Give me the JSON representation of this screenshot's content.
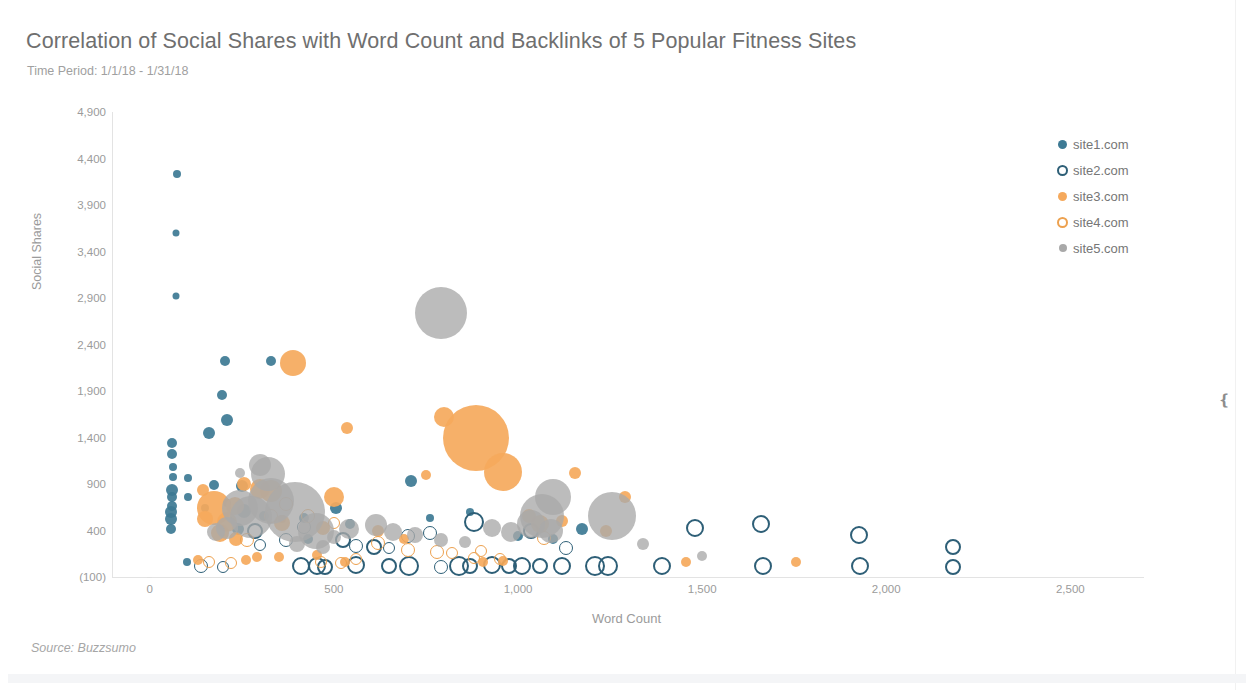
{
  "header": {
    "title": "Correlation of Social Shares with Word Count and Backlinks of 5 Popular Fitness Sites",
    "subtitle": "Time Period: 1/1/18 - 1/31/18"
  },
  "footer": {
    "source": "Source: Buzzsumo"
  },
  "right_widget": {
    "collapse_glyph": "❴"
  },
  "colors": {
    "site1": "#3d7a94",
    "site2": "#2e5f77",
    "site3": "#f5a95c",
    "site4": "#eda14f",
    "site5": "#a9a9a9",
    "axis_text": "#9b9b9b",
    "title_text": "#6f6f6f"
  },
  "chart_data": {
    "type": "scatter",
    "title": "Correlation of Social Shares with Word Count and Backlinks of 5 Popular Fitness Sites",
    "subtitle": "Time Period: 1/1/18 - 1/31/18",
    "xlabel": "Word Count",
    "ylabel": "Social Shares",
    "xlim": [
      -100,
      2700
    ],
    "ylim": [
      -100,
      4900
    ],
    "grid": false,
    "legend_position": "right",
    "size_encodes": "Backlinks",
    "xticks": [
      {
        "value": 0,
        "label": "0"
      },
      {
        "value": 500,
        "label": "500"
      },
      {
        "value": 1000,
        "label": "1,000"
      },
      {
        "value": 1500,
        "label": "1,500"
      },
      {
        "value": 2000,
        "label": "2,000"
      },
      {
        "value": 2500,
        "label": "2,500"
      }
    ],
    "yticks": [
      {
        "value": 4900,
        "label": "4,900"
      },
      {
        "value": 4400,
        "label": "4,400"
      },
      {
        "value": 3900,
        "label": "3,900"
      },
      {
        "value": 3400,
        "label": "3,400"
      },
      {
        "value": 2900,
        "label": "2,900"
      },
      {
        "value": 2400,
        "label": "2,400"
      },
      {
        "value": 1900,
        "label": "1,900"
      },
      {
        "value": 1400,
        "label": "1,400"
      },
      {
        "value": 900,
        "label": "900"
      },
      {
        "value": 400,
        "label": "400"
      },
      {
        "value": -100,
        "label": "(100)"
      }
    ],
    "series": [
      {
        "name": "site1.com",
        "marker": "filled-circle",
        "color": "#3d7a94",
        "points": [
          {
            "x": 75,
            "y": 4230,
            "r": 4
          },
          {
            "x": 70,
            "y": 3600,
            "r": 3.5
          },
          {
            "x": 70,
            "y": 2920,
            "r": 3.5
          },
          {
            "x": 205,
            "y": 2220,
            "r": 5
          },
          {
            "x": 330,
            "y": 2225,
            "r": 5
          },
          {
            "x": 195,
            "y": 1860,
            "r": 5
          },
          {
            "x": 160,
            "y": 1450,
            "r": 6
          },
          {
            "x": 210,
            "y": 1590,
            "r": 6
          },
          {
            "x": 60,
            "y": 1340,
            "r": 5
          },
          {
            "x": 60,
            "y": 1220,
            "r": 5
          },
          {
            "x": 62,
            "y": 1080,
            "r": 4
          },
          {
            "x": 62,
            "y": 980,
            "r": 4
          },
          {
            "x": 105,
            "y": 960,
            "r": 4
          },
          {
            "x": 60,
            "y": 840,
            "r": 6
          },
          {
            "x": 60,
            "y": 760,
            "r": 5
          },
          {
            "x": 60,
            "y": 660,
            "r": 5
          },
          {
            "x": 58,
            "y": 600,
            "r": 6
          },
          {
            "x": 58,
            "y": 520,
            "r": 6
          },
          {
            "x": 58,
            "y": 420,
            "r": 5
          },
          {
            "x": 105,
            "y": 760,
            "r": 4
          },
          {
            "x": 175,
            "y": 890,
            "r": 5
          },
          {
            "x": 150,
            "y": 640,
            "r": 4
          },
          {
            "x": 210,
            "y": 700,
            "r": 4
          },
          {
            "x": 250,
            "y": 880,
            "r": 6
          },
          {
            "x": 255,
            "y": 610,
            "r": 7
          },
          {
            "x": 240,
            "y": 420,
            "r": 6
          },
          {
            "x": 310,
            "y": 560,
            "r": 5
          },
          {
            "x": 360,
            "y": 520,
            "r": 4
          },
          {
            "x": 420,
            "y": 530,
            "r": 5
          },
          {
            "x": 505,
            "y": 640,
            "r": 6
          },
          {
            "x": 545,
            "y": 475,
            "r": 5
          },
          {
            "x": 710,
            "y": 930,
            "r": 6
          },
          {
            "x": 760,
            "y": 530,
            "r": 4
          },
          {
            "x": 870,
            "y": 600,
            "r": 4
          },
          {
            "x": 1000,
            "y": 340,
            "r": 5
          },
          {
            "x": 1095,
            "y": 310,
            "r": 5
          },
          {
            "x": 1175,
            "y": 420,
            "r": 6
          },
          {
            "x": 100,
            "y": 60,
            "r": 4
          },
          {
            "x": 430,
            "y": 310,
            "r": 5
          }
        ]
      },
      {
        "name": "site2.com",
        "marker": "hollow-circle",
        "color": "#2e5f77",
        "points": [
          {
            "x": 140,
            "y": 20,
            "r": 7
          },
          {
            "x": 200,
            "y": 10,
            "r": 6
          },
          {
            "x": 410,
            "y": 15,
            "r": 9
          },
          {
            "x": 455,
            "y": 20,
            "r": 9
          },
          {
            "x": 475,
            "y": 10,
            "r": 8
          },
          {
            "x": 560,
            "y": 25,
            "r": 9
          },
          {
            "x": 650,
            "y": 20,
            "r": 8
          },
          {
            "x": 705,
            "y": 15,
            "r": 10
          },
          {
            "x": 790,
            "y": 10,
            "r": 7
          },
          {
            "x": 840,
            "y": 20,
            "r": 10
          },
          {
            "x": 870,
            "y": 15,
            "r": 8
          },
          {
            "x": 930,
            "y": 25,
            "r": 9
          },
          {
            "x": 975,
            "y": 20,
            "r": 8
          },
          {
            "x": 1010,
            "y": 15,
            "r": 9
          },
          {
            "x": 1060,
            "y": 15,
            "r": 8
          },
          {
            "x": 1120,
            "y": 20,
            "r": 9
          },
          {
            "x": 1210,
            "y": 20,
            "r": 10
          },
          {
            "x": 1245,
            "y": 15,
            "r": 10
          },
          {
            "x": 1390,
            "y": 15,
            "r": 9
          },
          {
            "x": 1665,
            "y": 20,
            "r": 9
          },
          {
            "x": 1930,
            "y": 15,
            "r": 9
          },
          {
            "x": 2180,
            "y": 10,
            "r": 8
          },
          {
            "x": 525,
            "y": 300,
            "r": 8
          },
          {
            "x": 610,
            "y": 225,
            "r": 8
          },
          {
            "x": 700,
            "y": 340,
            "r": 7
          },
          {
            "x": 880,
            "y": 490,
            "r": 10
          },
          {
            "x": 760,
            "y": 370,
            "r": 7
          },
          {
            "x": 1035,
            "y": 400,
            "r": 8
          },
          {
            "x": 1480,
            "y": 430,
            "r": 9
          },
          {
            "x": 1660,
            "y": 470,
            "r": 9
          },
          {
            "x": 1925,
            "y": 350,
            "r": 9
          },
          {
            "x": 2180,
            "y": 220,
            "r": 8
          },
          {
            "x": 420,
            "y": 440,
            "r": 7
          },
          {
            "x": 370,
            "y": 300,
            "r": 7
          },
          {
            "x": 300,
            "y": 240,
            "r": 6
          },
          {
            "x": 285,
            "y": 390,
            "r": 8
          },
          {
            "x": 560,
            "y": 230,
            "r": 7
          },
          {
            "x": 650,
            "y": 210,
            "r": 6
          },
          {
            "x": 1130,
            "y": 210,
            "r": 7
          }
        ]
      },
      {
        "name": "site3.com",
        "marker": "filled-circle",
        "color": "#f5a95c",
        "points": [
          {
            "x": 390,
            "y": 2200,
            "r": 13
          },
          {
            "x": 800,
            "y": 1620,
            "r": 10
          },
          {
            "x": 885,
            "y": 1400,
            "r": 33
          },
          {
            "x": 960,
            "y": 1030,
            "r": 19
          },
          {
            "x": 535,
            "y": 1500,
            "r": 6
          },
          {
            "x": 750,
            "y": 1000,
            "r": 5
          },
          {
            "x": 1155,
            "y": 1020,
            "r": 6
          },
          {
            "x": 175,
            "y": 640,
            "r": 17
          },
          {
            "x": 145,
            "y": 840,
            "r": 6
          },
          {
            "x": 150,
            "y": 520,
            "r": 8
          },
          {
            "x": 210,
            "y": 490,
            "r": 10
          },
          {
            "x": 255,
            "y": 900,
            "r": 7
          },
          {
            "x": 300,
            "y": 850,
            "r": 10
          },
          {
            "x": 330,
            "y": 820,
            "r": 11
          },
          {
            "x": 230,
            "y": 660,
            "r": 9
          },
          {
            "x": 190,
            "y": 370,
            "r": 9
          },
          {
            "x": 235,
            "y": 310,
            "r": 7
          },
          {
            "x": 360,
            "y": 480,
            "r": 8
          },
          {
            "x": 500,
            "y": 760,
            "r": 10
          },
          {
            "x": 470,
            "y": 430,
            "r": 7
          },
          {
            "x": 620,
            "y": 400,
            "r": 6
          },
          {
            "x": 690,
            "y": 310,
            "r": 5
          },
          {
            "x": 1030,
            "y": 560,
            "r": 7
          },
          {
            "x": 1060,
            "y": 470,
            "r": 9
          },
          {
            "x": 1120,
            "y": 500,
            "r": 6
          },
          {
            "x": 1240,
            "y": 400,
            "r": 6
          },
          {
            "x": 1290,
            "y": 760,
            "r": 6
          },
          {
            "x": 1455,
            "y": 60,
            "r": 5
          },
          {
            "x": 1755,
            "y": 60,
            "r": 5
          },
          {
            "x": 290,
            "y": 120,
            "r": 5
          },
          {
            "x": 350,
            "y": 110,
            "r": 5
          },
          {
            "x": 455,
            "y": 140,
            "r": 5
          },
          {
            "x": 530,
            "y": 60,
            "r": 5
          },
          {
            "x": 905,
            "y": 60,
            "r": 5
          },
          {
            "x": 960,
            "y": 70,
            "r": 5
          },
          {
            "x": 130,
            "y": 80,
            "r": 5
          },
          {
            "x": 260,
            "y": 80,
            "r": 5
          }
        ]
      },
      {
        "name": "site4.com",
        "marker": "hollow-circle",
        "color": "#eda14f",
        "points": [
          {
            "x": 370,
            "y": 690,
            "r": 7
          },
          {
            "x": 430,
            "y": 560,
            "r": 7
          },
          {
            "x": 330,
            "y": 560,
            "r": 7
          },
          {
            "x": 265,
            "y": 300,
            "r": 7
          },
          {
            "x": 500,
            "y": 480,
            "r": 6
          },
          {
            "x": 620,
            "y": 270,
            "r": 7
          },
          {
            "x": 700,
            "y": 190,
            "r": 7
          },
          {
            "x": 780,
            "y": 170,
            "r": 7
          },
          {
            "x": 820,
            "y": 160,
            "r": 6
          },
          {
            "x": 900,
            "y": 180,
            "r": 6
          },
          {
            "x": 1070,
            "y": 320,
            "r": 7
          },
          {
            "x": 880,
            "y": 100,
            "r": 6
          },
          {
            "x": 950,
            "y": 90,
            "r": 6
          },
          {
            "x": 465,
            "y": 60,
            "r": 6
          },
          {
            "x": 520,
            "y": 50,
            "r": 6
          },
          {
            "x": 560,
            "y": 90,
            "r": 6
          },
          {
            "x": 160,
            "y": 60,
            "r": 6
          },
          {
            "x": 220,
            "y": 50,
            "r": 6
          }
        ]
      },
      {
        "name": "site5.com",
        "marker": "filled-circle",
        "color": "#a9a9a9",
        "points": [
          {
            "x": 790,
            "y": 2740,
            "r": 26
          },
          {
            "x": 300,
            "y": 1100,
            "r": 11
          },
          {
            "x": 320,
            "y": 1010,
            "r": 17
          },
          {
            "x": 245,
            "y": 1020,
            "r": 5
          },
          {
            "x": 330,
            "y": 720,
            "r": 23
          },
          {
            "x": 395,
            "y": 600,
            "r": 30
          },
          {
            "x": 245,
            "y": 640,
            "r": 18
          },
          {
            "x": 275,
            "y": 540,
            "r": 21
          },
          {
            "x": 450,
            "y": 400,
            "r": 18
          },
          {
            "x": 210,
            "y": 430,
            "r": 11
          },
          {
            "x": 180,
            "y": 380,
            "r": 9
          },
          {
            "x": 500,
            "y": 330,
            "r": 7
          },
          {
            "x": 540,
            "y": 420,
            "r": 10
          },
          {
            "x": 615,
            "y": 460,
            "r": 11
          },
          {
            "x": 660,
            "y": 380,
            "r": 9
          },
          {
            "x": 1095,
            "y": 760,
            "r": 18
          },
          {
            "x": 1065,
            "y": 560,
            "r": 22
          },
          {
            "x": 1035,
            "y": 470,
            "r": 14
          },
          {
            "x": 1090,
            "y": 400,
            "r": 12
          },
          {
            "x": 1255,
            "y": 560,
            "r": 24
          },
          {
            "x": 980,
            "y": 380,
            "r": 10
          },
          {
            "x": 930,
            "y": 430,
            "r": 9
          },
          {
            "x": 1340,
            "y": 250,
            "r": 6
          },
          {
            "x": 1500,
            "y": 130,
            "r": 5
          },
          {
            "x": 720,
            "y": 350,
            "r": 8
          },
          {
            "x": 790,
            "y": 300,
            "r": 7
          },
          {
            "x": 855,
            "y": 280,
            "r": 6
          },
          {
            "x": 400,
            "y": 250,
            "r": 8
          },
          {
            "x": 470,
            "y": 220,
            "r": 7
          }
        ]
      }
    ]
  },
  "legend": {
    "items": [
      {
        "label": "site1.com",
        "key": "site1"
      },
      {
        "label": "site2.com",
        "key": "site2"
      },
      {
        "label": "site3.com",
        "key": "site3"
      },
      {
        "label": "site4.com",
        "key": "site4"
      },
      {
        "label": "site5.com",
        "key": "site5"
      }
    ]
  }
}
